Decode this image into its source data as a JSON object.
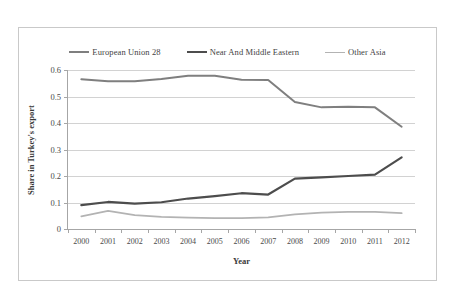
{
  "chart_data": {
    "type": "line",
    "title": "",
    "xlabel": "Year",
    "ylabel": "Share in Turkey's export",
    "categories": [
      "2000",
      "2001",
      "2002",
      "2003",
      "2004",
      "2005",
      "2006",
      "2007",
      "2008",
      "2009",
      "2010",
      "2011",
      "2012"
    ],
    "ylim": [
      0,
      0.6
    ],
    "yticks": [
      "0",
      "0.1",
      "0.2",
      "0.3",
      "0.4",
      "0.5",
      "0.6"
    ],
    "ytick_values": [
      0,
      0.1,
      0.2,
      0.3,
      0.4,
      0.5,
      0.6
    ],
    "grid": "horizontal",
    "legend_position": "top-center",
    "series": [
      {
        "name": "European Union 28",
        "color": "#7f7f7f",
        "width": 2.0,
        "values": [
          0.565,
          0.558,
          0.558,
          0.566,
          0.578,
          0.578,
          0.563,
          0.562,
          0.479,
          0.459,
          0.461,
          0.459,
          0.386
        ]
      },
      {
        "name": "Near And Middle Eastern",
        "color": "#4d4d4d",
        "width": 2.2,
        "values": [
          0.09,
          0.102,
          0.096,
          0.101,
          0.115,
          0.124,
          0.135,
          0.13,
          0.19,
          0.195,
          0.2,
          0.205,
          0.27
        ]
      },
      {
        "name": "Other Asia",
        "color": "#b3b3b3",
        "width": 1.8,
        "values": [
          0.048,
          0.068,
          0.052,
          0.046,
          0.043,
          0.041,
          0.041,
          0.044,
          0.055,
          0.062,
          0.065,
          0.065,
          0.06
        ]
      }
    ]
  },
  "legend": {
    "items": [
      {
        "label": "European Union 28",
        "color": "#7f7f7f",
        "width": "2px"
      },
      {
        "label": "Near And Middle Eastern",
        "color": "#4d4d4d",
        "width": "2.5px"
      },
      {
        "label": "Other Asia",
        "color": "#b3b3b3",
        "width": "1.8px"
      }
    ]
  },
  "axes": {
    "y_title": "Share in Turkey's export",
    "x_title": "Year"
  }
}
